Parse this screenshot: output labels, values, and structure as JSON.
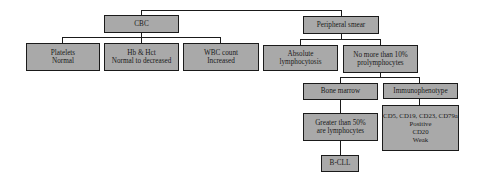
{
  "colors": {
    "box_fill": "#a9a9a9",
    "border": "#1a1a1a",
    "background": "#ffffff"
  },
  "nodes": {
    "cbc": {
      "lines": [
        "CBC"
      ]
    },
    "platelets": {
      "lines": [
        "Platelets",
        "Normal"
      ]
    },
    "hb_hct": {
      "lines": [
        "Hb & Hct",
        "Normal to decreased"
      ]
    },
    "wbc": {
      "lines": [
        "WBC count",
        "Increased"
      ]
    },
    "peripheral_smear": {
      "lines": [
        "Peripheral smear"
      ]
    },
    "absolute_lymphocytosis": {
      "lines": [
        "Absolute",
        "lymphocytosis"
      ]
    },
    "prolymphocytes": {
      "lines": [
        "No more than 10%",
        "prolymphocytes"
      ]
    },
    "bone_marrow": {
      "lines": [
        "Bone marrow"
      ]
    },
    "immunophenotype": {
      "lines": [
        "Immunophenotype"
      ]
    },
    "greater_50": {
      "lines": [
        "Greater than 50%",
        "are lymphocytes"
      ]
    },
    "immuno_details": {
      "lines": [
        "CD5, CD19, CD23, CD79a",
        "Positive",
        "CD20",
        "Weak"
      ]
    },
    "bcll": {
      "lines": [
        "B-CLL"
      ]
    }
  }
}
